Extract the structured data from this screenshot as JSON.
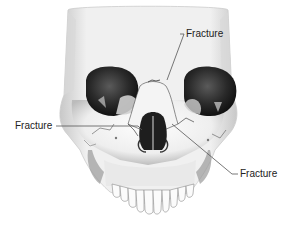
{
  "figure": {
    "labels": [
      {
        "id": "top",
        "text": "Fracture"
      },
      {
        "id": "left",
        "text": "Fracture"
      },
      {
        "id": "right",
        "text": "Fracture"
      }
    ]
  },
  "colors": {
    "bone": "#f2f2f2",
    "bone_shadow": "#9a9a9a",
    "cavity": "#1e1e1e",
    "leader_line": "#555555",
    "text": "#222222"
  }
}
